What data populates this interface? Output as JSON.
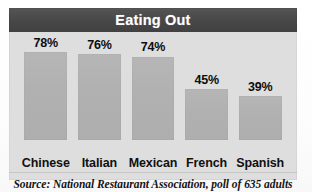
{
  "figure": {
    "title": "Eating Out",
    "source_note": "Source: National Restaurant Association, poll of 635 adults"
  },
  "colors": {
    "title_bar": "#4c4c4c",
    "title_text": "#ffffff",
    "panel_background": "#dedede",
    "bar_fill": "#b2b2b2",
    "label_text": "#0d0d0d",
    "page_background": "#ffffff"
  },
  "chart_data": {
    "type": "bar",
    "title": "Eating Out",
    "subtitle": "",
    "xlabel": "",
    "ylabel": "",
    "categories": [
      "Chinese",
      "Italian",
      "Mexican",
      "French",
      "Spanish"
    ],
    "values": [
      78,
      76,
      74,
      45,
      39
    ],
    "value_labels": [
      "78%",
      "76%",
      "74%",
      "45%",
      "39%"
    ],
    "unit": "%",
    "ylim": [
      0,
      100
    ],
    "grid": false,
    "legend": "none",
    "annotations": [
      "Source: National Restaurant Association, poll of 635 adults"
    ]
  }
}
